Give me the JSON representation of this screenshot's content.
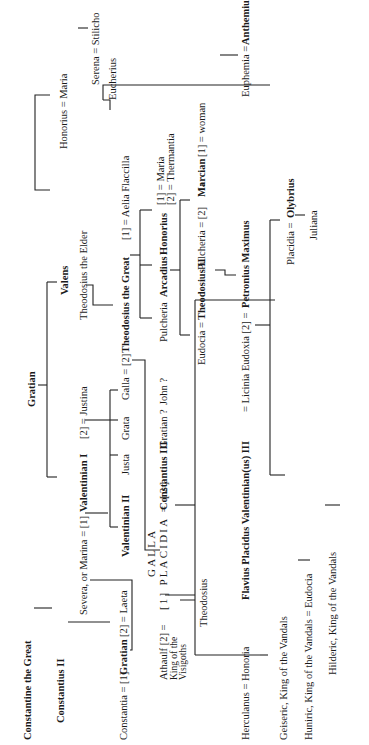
{
  "diagram": {
    "type": "family-tree",
    "orientation": "rotated-90-ccw",
    "nodes": {
      "constantine": "Constantine the Great",
      "constantius2": "Constantius II",
      "constantia_line": "Constantia = [1]",
      "gratian_son": "Gratian",
      "laeta": "[2] = Laeta",
      "severa": "Severa, or Marina = [1]",
      "valentinian1": "Valentinian I",
      "justina": "[2] = Justina",
      "gratian_top": "Gratian",
      "valens": "Valens",
      "valentinian2": "Valentinian II",
      "justa": "Justa",
      "grata": "Grata",
      "galla": "Galla = [2]",
      "theodosius_elder": "Theodosius the Elder",
      "theodosius_great": "Theodosius the Great",
      "aelia": "[1] = Aelia Flaccilla",
      "honorius_maria": "Honorius = Maria",
      "serena_stilicho": "Serena = Stilicho",
      "eucherius": "Eucherius",
      "gratian_q": "Gratian ?",
      "john_q": "John ?",
      "pulcheria1": "Pulcheria",
      "arcadius": "Arcadius",
      "honorius": "Honorius",
      "honorius_wives_1": "[1] = Maria",
      "honorius_wives_2": "[2] = Thermantia",
      "galla_placidia_top": "GALLA",
      "galla_placidia_main": "[1] PLACIDIA = [2]",
      "athaulf": "Athaulf [2] =",
      "athaulf_title_1": "King of the",
      "athaulf_title_2": "Visigoths",
      "constantius3": "Constantius III",
      "theodosius_child": "Theodosius",
      "eudocia": "Eudocia =",
      "theodosius2": "Theodosius II",
      "pulcheria2": "Pulcheria = [2]",
      "marcian": "Marcian",
      "marcian_wife": "[1] = woman",
      "euphemia": "Euphemia =",
      "anthemius": "Anthemius",
      "herculanus": "Herculanus = Honoria",
      "valentinian3": "Flavius Placidus Valentinian(us) III",
      "licinia": "= Licinia Eudoxia [2] =",
      "petronius": "Petronius Maximus",
      "placidia": "Placidia =",
      "olybrius": "Olybrius",
      "juliana": "Juliana",
      "geiseric": "Geiseric, King of the Vandals",
      "huniric": "Huniric, King of the Vandals = Eudocia",
      "hilderic": "Hilderic, King of the Vandals"
    }
  }
}
